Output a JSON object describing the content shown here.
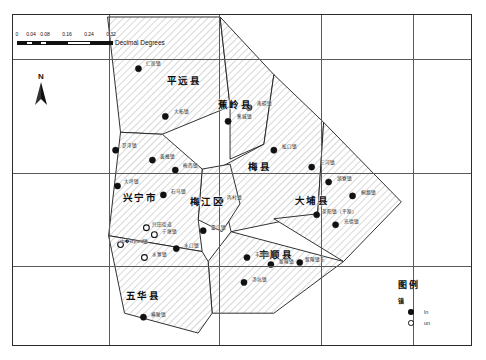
{
  "figure": {
    "width": 486,
    "height": 360,
    "background": "#ffffff"
  },
  "scalebar": {
    "tick_labels": [
      "0",
      "0.04",
      "0.08",
      "0.16",
      "0.24",
      "0.32"
    ],
    "units_label": "Decimal Degrees"
  },
  "north_arrow": {
    "letter": "N",
    "name": "north-arrow"
  },
  "legend": {
    "title": "图例",
    "subtitle": "镇",
    "entries": [
      {
        "symbol": "filled-circle",
        "label": "ln"
      },
      {
        "symbol": "hollow-circle",
        "label": "un"
      }
    ]
  },
  "map_data": {
    "type": "choropleth-outline",
    "fill_style": "diagonal-hatch",
    "stroke_color": "#1a1a1a",
    "graticule": {
      "visible": true,
      "color": "#5a5a5a",
      "horizontal_y": [
        58,
        172,
        265
      ],
      "vertical_x": [
        108,
        218,
        320,
        412
      ]
    },
    "counties": [
      {
        "name": "平远县",
        "label_x": 183,
        "label_y": 79
      },
      {
        "name": "蕉岭县",
        "label_x": 234,
        "label_y": 103
      },
      {
        "name": "梅县",
        "label_x": 259,
        "label_y": 165
      },
      {
        "name": "梅江区",
        "label_x": 206,
        "label_y": 200
      },
      {
        "name": "大埔县",
        "label_x": 311,
        "label_y": 199
      },
      {
        "name": "兴宁市",
        "label_x": 139,
        "label_y": 196
      },
      {
        "name": "丰顺县",
        "label_x": 275,
        "label_y": 253
      },
      {
        "name": "五华县",
        "label_x": 142,
        "label_y": 294
      }
    ],
    "towns": [
      {
        "name": "仁居镇",
        "x": 138,
        "y": 68,
        "label_x": 152,
        "label_y": 62,
        "symbol": "filled"
      },
      {
        "name": "大柘镇",
        "x": 165,
        "y": 116,
        "label_x": 180,
        "label_y": 110,
        "symbol": "filled"
      },
      {
        "name": "蕉城镇",
        "x": 228,
        "y": 121,
        "label_x": 243,
        "label_y": 115,
        "symbol": "filled"
      },
      {
        "name": "南磜镇",
        "x": 249,
        "y": 107,
        "label_x": 263,
        "label_y": 102,
        "symbol": "filled"
      },
      {
        "name": "罗浮镇",
        "x": 115,
        "y": 150,
        "label_x": 128,
        "label_y": 144,
        "symbol": "filled"
      },
      {
        "name": "黄槐镇",
        "x": 152,
        "y": 160,
        "label_x": 166,
        "label_y": 155,
        "symbol": "filled"
      },
      {
        "name": "梅西镇",
        "x": 175,
        "y": 170,
        "label_x": 189,
        "label_y": 164,
        "symbol": "filled"
      },
      {
        "name": "松口镇",
        "x": 274,
        "y": 150,
        "label_x": 288,
        "label_y": 145,
        "symbol": "filled"
      },
      {
        "name": "三河镇",
        "x": 312,
        "y": 167,
        "label_x": 326,
        "label_y": 161,
        "symbol": "filled"
      },
      {
        "name": "大坪镇",
        "x": 117,
        "y": 186,
        "label_x": 130,
        "label_y": 180,
        "symbol": "filled"
      },
      {
        "name": "石马镇",
        "x": 163,
        "y": 195,
        "label_x": 177,
        "label_y": 190,
        "symbol": "filled"
      },
      {
        "name": "丙村镇",
        "x": 220,
        "y": 201,
        "label_x": 233,
        "label_y": 196,
        "symbol": "filled"
      },
      {
        "name": "湖寮镇",
        "x": 329,
        "y": 182,
        "label_x": 343,
        "label_y": 177,
        "symbol": "filled"
      },
      {
        "name": "桐烟镇",
        "x": 353,
        "y": 196,
        "label_x": 367,
        "label_y": 191,
        "symbol": "filled"
      },
      {
        "name": "茶阳镇（平原）",
        "x": 317,
        "y": 215,
        "label_x": 338,
        "label_y": 210,
        "symbol": "filled"
      },
      {
        "name": "光德镇",
        "x": 336,
        "y": 225,
        "label_x": 350,
        "label_y": 220,
        "symbol": "filled"
      },
      {
        "name": "兴田街道",
        "x": 146,
        "y": 228,
        "label_x": 161,
        "label_y": 223,
        "symbol": "hollow"
      },
      {
        "name": "宁塘镇",
        "x": 154,
        "y": 235,
        "label_x": 168,
        "label_y": 230,
        "symbol": "hollow"
      },
      {
        "name": "畲江镇",
        "x": 203,
        "y": 231,
        "label_x": 217,
        "label_y": 226,
        "symbol": "filled"
      },
      {
        "name": "中�styled镇",
        "x": 120,
        "y": 245,
        "label_x": 133,
        "label_y": 240,
        "symbol": "hollow"
      },
      {
        "name": "水口镇",
        "x": 176,
        "y": 249,
        "label_x": 190,
        "label_y": 244,
        "symbol": "filled"
      },
      {
        "name": "水寨镇",
        "x": 144,
        "y": 258,
        "label_x": 158,
        "label_y": 253,
        "symbol": "hollow"
      },
      {
        "name": "丰良镇",
        "x": 247,
        "y": 258,
        "label_x": 261,
        "label_y": 253,
        "symbol": "filled"
      },
      {
        "name": "留隍镇",
        "x": 271,
        "y": 265,
        "label_x": 285,
        "label_y": 260,
        "symbol": "filled"
      },
      {
        "name": "留隍镇东",
        "x": 300,
        "y": 263,
        "label_x": 314,
        "label_y": 258,
        "symbol": "filled"
      },
      {
        "name": "汤坑镇",
        "x": 244,
        "y": 283,
        "label_x": 258,
        "label_y": 278,
        "symbol": "filled"
      },
      {
        "name": "横陂镇",
        "x": 143,
        "y": 318,
        "label_x": 157,
        "label_y": 313,
        "symbol": "filled"
      }
    ]
  }
}
